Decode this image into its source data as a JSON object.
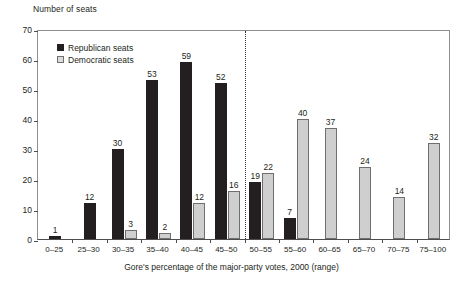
{
  "chart_data": {
    "type": "bar",
    "title": "",
    "ylabel": "Number of seats",
    "xlabel": "Gore's percentage of the major-party votes, 2000 (range)",
    "ylim": [
      0,
      70
    ],
    "yticks": [
      0,
      10,
      20,
      30,
      40,
      50,
      60,
      70
    ],
    "grid": false,
    "legend_position": "top-left",
    "categories": [
      "0–25",
      "25–30",
      "30–35",
      "35–40",
      "40–45",
      "45–50",
      "50–55",
      "55–60",
      "60–65",
      "65–70",
      "70–75",
      "75–100"
    ],
    "series": [
      {
        "name": "Republican seats",
        "color": "#231f20",
        "values": [
          1,
          12,
          30,
          53,
          59,
          52,
          19,
          7,
          null,
          null,
          null,
          null
        ],
        "labels": [
          "1",
          "12",
          "30",
          "53",
          "59",
          "52",
          "19",
          "7",
          "",
          "",
          "",
          ""
        ]
      },
      {
        "name": "Democratic seats",
        "color": "#cfcfcf",
        "values": [
          null,
          null,
          3,
          2,
          12,
          16,
          22,
          40,
          37,
          24,
          14,
          32
        ],
        "labels": [
          "",
          "",
          "3",
          "2",
          "12",
          "16",
          "22",
          "40",
          "37",
          "24",
          "14",
          "32"
        ]
      }
    ],
    "annotations": [
      {
        "type": "vline",
        "name": "fifty-percent-divider",
        "between_categories": [
          "45–50",
          "50–55"
        ],
        "style": "dotted"
      }
    ]
  },
  "legend": {
    "items": [
      {
        "label": "Republican seats"
      },
      {
        "label": "Democratic seats"
      }
    ]
  }
}
